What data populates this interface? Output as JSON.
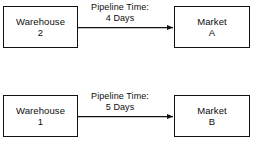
{
  "diagram": {
    "type": "flow-diagram",
    "background_color": "#ffffff",
    "line_color": "#111111",
    "text_color": "#0d0d0d",
    "flows": [
      {
        "id": "flow-top",
        "source": {
          "name_line1": "Warehouse",
          "name_line2": "2"
        },
        "target": {
          "name_line1": "Market",
          "name_line2": "A"
        },
        "edge_label_line1": "Pipeline Time:",
        "edge_label_line2": "4 Days",
        "pipeline_days": 4
      },
      {
        "id": "flow-bottom",
        "source": {
          "name_line1": "Warehouse",
          "name_line2": "1"
        },
        "target": {
          "name_line1": "Market",
          "name_line2": "B"
        },
        "edge_label_line1": "Pipeline Time:",
        "edge_label_line2": "5 Days",
        "pipeline_days": 5
      }
    ]
  }
}
